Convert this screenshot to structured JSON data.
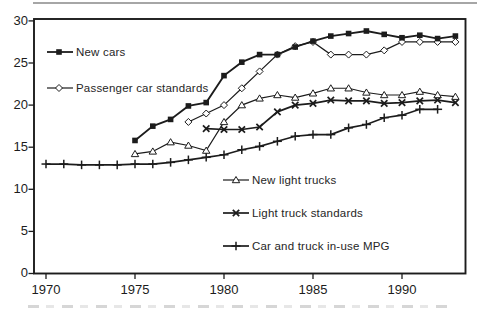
{
  "figure": {
    "background": "#ffffff",
    "ink_color": "#1c1c1c",
    "artifacts": {
      "top_rule": "cropped gray horizontal rule at very top",
      "bottom_band": "cropped illegible caption text band at very bottom"
    }
  },
  "chart_data": {
    "type": "line",
    "title": "",
    "xlabel": "",
    "ylabel": "",
    "grid": false,
    "legend_position": "inside-plot",
    "x_range": [
      1969.3,
      1993.6
    ],
    "ylim": [
      0,
      30
    ],
    "x_ticks": [
      1970,
      1975,
      1980,
      1985,
      1990
    ],
    "x_tick_labels": [
      "1970",
      "1975",
      "1980",
      "1985",
      "1990"
    ],
    "y_ticks": [
      0,
      5,
      10,
      15,
      20,
      25,
      30
    ],
    "y_tick_labels": [
      "0",
      "5",
      "10",
      "15",
      "20",
      "25",
      "30"
    ],
    "units": "miles per gallon",
    "series": [
      {
        "id": "new_cars",
        "name": "New cars",
        "marker": "filled-square",
        "line_width": 1.8,
        "years": [
          1975,
          1976,
          1977,
          1978,
          1979,
          1980,
          1981,
          1982,
          1983,
          1984,
          1985,
          1986,
          1987,
          1988,
          1989,
          1990,
          1991,
          1992,
          1993
        ],
        "values": [
          15.8,
          17.5,
          18.3,
          19.9,
          20.3,
          23.5,
          25.1,
          26.0,
          26.0,
          26.9,
          27.6,
          28.2,
          28.5,
          28.8,
          28.4,
          28.0,
          28.3,
          27.9,
          28.2
        ]
      },
      {
        "id": "passenger_car_standards",
        "name": "Passenger car standards",
        "marker": "open-diamond",
        "line_width": 1.2,
        "years": [
          1978,
          1979,
          1980,
          1981,
          1982,
          1983,
          1984,
          1985,
          1986,
          1987,
          1988,
          1989,
          1990,
          1991,
          1992,
          1993
        ],
        "values": [
          18.0,
          19.0,
          20.0,
          22.0,
          24.0,
          26.0,
          27.0,
          27.5,
          26.0,
          26.0,
          26.0,
          26.5,
          27.5,
          27.5,
          27.5,
          27.5
        ]
      },
      {
        "id": "new_light_trucks",
        "name": "New light trucks",
        "marker": "open-triangle",
        "line_width": 1.2,
        "years": [
          1975,
          1976,
          1977,
          1978,
          1979,
          1980,
          1981,
          1982,
          1983,
          1984,
          1985,
          1986,
          1987,
          1988,
          1989,
          1990,
          1991,
          1992,
          1993
        ],
        "values": [
          14.2,
          14.5,
          15.6,
          15.2,
          14.6,
          18.0,
          20.0,
          20.8,
          21.2,
          20.9,
          21.4,
          22.0,
          22.0,
          21.5,
          21.2,
          21.2,
          21.6,
          21.2,
          21.0
        ]
      },
      {
        "id": "light_truck_standards",
        "name": "Light truck standards",
        "marker": "x-cross",
        "line_width": 1.7,
        "years": [
          1979,
          1980,
          1981,
          1982,
          1983,
          1984,
          1985,
          1986,
          1987,
          1988,
          1989,
          1990,
          1991,
          1992,
          1993
        ],
        "values": [
          17.2,
          17.1,
          17.1,
          17.4,
          19.2,
          20.0,
          20.2,
          20.6,
          20.5,
          20.5,
          20.2,
          20.3,
          20.5,
          20.6,
          20.3
        ]
      },
      {
        "id": "car_and_truck_in_use",
        "name": "Car and truck in-use MPG",
        "marker": "plus-cross",
        "line_width": 1.7,
        "years": [
          1970,
          1971,
          1972,
          1973,
          1974,
          1975,
          1976,
          1977,
          1978,
          1979,
          1980,
          1981,
          1982,
          1983,
          1984,
          1985,
          1986,
          1987,
          1988,
          1989,
          1990,
          1991,
          1992
        ],
        "values": [
          13.0,
          13.0,
          12.9,
          12.9,
          12.9,
          13.0,
          13.0,
          13.2,
          13.5,
          13.8,
          14.1,
          14.7,
          15.1,
          15.7,
          16.3,
          16.5,
          16.5,
          17.3,
          17.7,
          18.5,
          18.8,
          19.5,
          19.5
        ]
      }
    ],
    "legend": [
      {
        "series": "new_cars",
        "sample_x": 47,
        "sample_y": 52,
        "glyph_x": 59
      },
      {
        "series": "passenger_car_standards",
        "sample_x": 47,
        "sample_y": 88,
        "glyph_x": 59
      },
      {
        "series": "new_light_trucks",
        "sample_x": 223,
        "sample_y": 180,
        "glyph_x": 236
      },
      {
        "series": "light_truck_standards",
        "sample_x": 223,
        "sample_y": 213,
        "glyph_x": 236
      },
      {
        "series": "car_and_truck_in_use",
        "sample_x": 223,
        "sample_y": 246,
        "glyph_x": 236
      }
    ]
  }
}
